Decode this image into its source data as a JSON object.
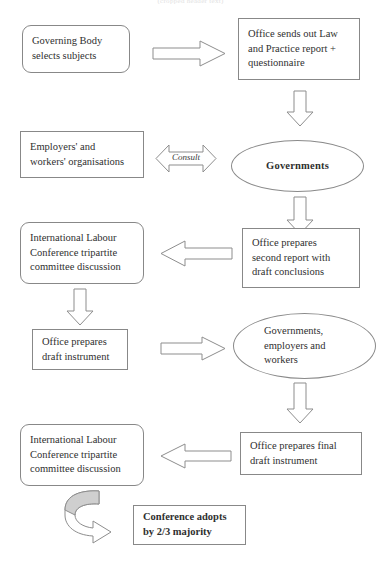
{
  "diagram": {
    "title_fragment": "(cropped header text)",
    "stroke_color": "#888888",
    "fill_color": "#ffffff",
    "curved_arrow_shade": "#cccccc"
  },
  "nodes": {
    "governing_body": {
      "line1": "Governing Body",
      "line2": "selects subjects"
    },
    "office_law_practice": {
      "line1": "Office sends out Law",
      "line2": "and Practice report +",
      "line3": "questionnaire"
    },
    "employers_workers": {
      "line1": "Employers' and",
      "line2": "workers' organisations"
    },
    "governments": {
      "line1": "Governments"
    },
    "ilc_committee_1": {
      "line1": "International Labour",
      "line2": "Conference tripartite",
      "line3": "committee discussion"
    },
    "office_second_report": {
      "line1": "Office prepares",
      "line2": "second report with",
      "line3": "draft conclusions"
    },
    "office_draft_instrument": {
      "line1": "Office prepares",
      "line2": "draft instrument"
    },
    "governments_employers_workers": {
      "line1": "Governments,",
      "line2": "employers and",
      "line3": "workers"
    },
    "ilc_committee_2": {
      "line1": "International Labour",
      "line2": "Conference tripartite",
      "line3": "committee discussion"
    },
    "office_final_draft": {
      "line1": "Office prepares final",
      "line2": "draft instrument"
    },
    "conference_adopts": {
      "line1": "Conference adopts",
      "line2": "by 2/3 majority"
    }
  },
  "arrows": {
    "gb_to_office": {
      "name": "arrow-right-governing-body-to-office",
      "direction": "right"
    },
    "office_down_1": {
      "name": "arrow-down-office-to-governments",
      "direction": "down"
    },
    "consult": {
      "name": "arrow-double-consult",
      "direction": "double-horizontal",
      "label": "Consult"
    },
    "governments_down": {
      "name": "arrow-down-governments-to-second-report",
      "direction": "down"
    },
    "second_report_left": {
      "name": "arrow-left-second-report-to-committee",
      "direction": "left"
    },
    "committee_down_1": {
      "name": "arrow-down-committee-to-draft-instrument",
      "direction": "down"
    },
    "draft_to_gew": {
      "name": "arrow-right-draft-instrument-to-stakeholders",
      "direction": "right"
    },
    "gew_down": {
      "name": "arrow-down-stakeholders-to-final-draft",
      "direction": "down"
    },
    "final_draft_left": {
      "name": "arrow-left-final-draft-to-committee",
      "direction": "left"
    },
    "loop_back": {
      "name": "arrow-curved-loop-to-conference-adopts",
      "direction": "curved"
    }
  }
}
